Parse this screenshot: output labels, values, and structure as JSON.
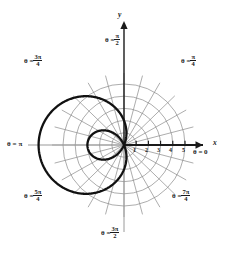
{
  "figure": {
    "background_color": "#ffffff",
    "grid_color": "#8a8a8a",
    "axis_color": "#1a1a1a",
    "curve_color": "#111111",
    "width": 246,
    "height": 256
  },
  "axes": {
    "x_label": "x",
    "y_label": "y",
    "center_x": 124,
    "center_y": 145,
    "unit_px": 12.2
  },
  "angle_labels": [
    {
      "name": "theta-0",
      "prefix": "θ =",
      "value": "0",
      "type": "plain",
      "x": 196,
      "y": 152
    },
    {
      "name": "theta-pi-4",
      "prefix": "θ =",
      "num": "π",
      "den": "4",
      "type": "frac",
      "x": 184,
      "y": 57
    },
    {
      "name": "theta-pi-2",
      "prefix": "θ =",
      "num": "π",
      "den": "2",
      "type": "frac",
      "x": 108,
      "y": 37
    },
    {
      "name": "theta-3pi-4",
      "prefix": "θ =",
      "num": "3π",
      "den": "4",
      "type": "frac",
      "x": 27,
      "y": 57
    },
    {
      "name": "theta-pi",
      "prefix": "θ =",
      "value": "π",
      "type": "plain",
      "x": 9,
      "y": 141
    },
    {
      "name": "theta-5pi-4",
      "prefix": "θ =",
      "num": "5π",
      "den": "4",
      "type": "frac",
      "x": 27,
      "y": 192
    },
    {
      "name": "theta-3pi-2",
      "prefix": "θ =",
      "num": "3π",
      "den": "2",
      "type": "frac",
      "x": 104,
      "y": 229
    },
    {
      "name": "theta-7pi-4",
      "prefix": "θ =",
      "num": "7π",
      "den": "4",
      "type": "frac",
      "x": 175,
      "y": 192
    }
  ],
  "x_ticks": [
    {
      "label": "1",
      "r": 1,
      "x": 133,
      "y": 148
    },
    {
      "label": "2",
      "r": 2,
      "x": 146,
      "y": 148
    },
    {
      "label": "3",
      "r": 3,
      "x": 158,
      "y": 148
    },
    {
      "label": "4",
      "r": 4,
      "x": 170,
      "y": 148
    },
    {
      "label": "5",
      "r": 5,
      "x": 182,
      "y": 148
    }
  ],
  "chart_data": {
    "type": "line",
    "coordinate_system": "polar",
    "title": "",
    "xlabel": "x",
    "ylabel": "y",
    "grid": true,
    "grid_circles": [
      1,
      2,
      3,
      4,
      5
    ],
    "radial_spoke_step_deg": 15,
    "angle_tick_labels": [
      "θ = 0",
      "θ = π/4",
      "θ = π/2",
      "θ = 3π/4",
      "θ = π",
      "θ = 5π/4",
      "θ = 3π/2",
      "θ = 7π/4"
    ],
    "r_tick_labels": [
      "1",
      "2",
      "3",
      "4",
      "5"
    ],
    "rlim": [
      0,
      5
    ],
    "series": [
      {
        "name": "limacon",
        "equation": "r = 2 + 5·cos(θ + π)",
        "curve_family": "limacon-with-inner-loop",
        "a": 2,
        "b": 5,
        "orientation": "opens-left",
        "max_radius": 7,
        "inner_loop_radius": 3,
        "theta_deg": [
          0,
          15,
          30,
          45,
          60,
          75,
          90,
          105,
          120,
          135,
          150,
          165,
          180,
          195,
          210,
          225,
          240,
          255,
          270,
          285,
          300,
          315,
          330,
          345,
          360
        ],
        "r": [
          -3.0,
          -2.83,
          -2.33,
          -1.54,
          -0.5,
          0.71,
          2.0,
          3.29,
          4.5,
          5.54,
          6.33,
          6.83,
          7.0,
          6.83,
          6.33,
          5.54,
          4.5,
          3.29,
          2.0,
          0.71,
          -0.5,
          -1.54,
          -2.33,
          -2.83,
          -3.0
        ]
      }
    ]
  }
}
